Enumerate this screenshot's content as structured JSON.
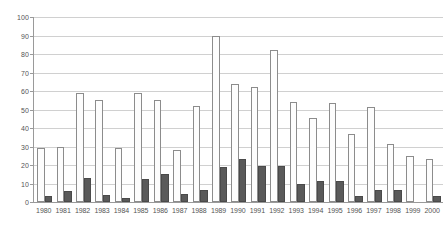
{
  "chart_data": {
    "type": "bar",
    "title": "",
    "subtitle": "",
    "xlabel": "",
    "ylabel": "",
    "ylim": [
      0,
      100
    ],
    "ytick_step": 10,
    "yticks": [
      0,
      10,
      20,
      30,
      40,
      50,
      60,
      70,
      80,
      90,
      100
    ],
    "ytick_labels": [
      "0",
      "10",
      "20",
      "30",
      "40",
      "50",
      "60",
      "70",
      "80",
      "90",
      "100"
    ],
    "grid": "horizontal",
    "legend": "none",
    "legend_position": "none",
    "annotations": [],
    "categories": [
      "1980",
      "1981",
      "1982",
      "1983",
      "1984",
      "1985",
      "1986",
      "1987",
      "1988",
      "1989",
      "1990",
      "1991",
      "1992",
      "1993",
      "1994",
      "1995",
      "1996",
      "1997",
      "1998",
      "1999",
      "2000"
    ],
    "series": [
      {
        "name": "light-series",
        "color": "#fdfdfd",
        "border_color": "#8c8c8c",
        "values": [
          29,
          30,
          59,
          55,
          29,
          59,
          55,
          28,
          52,
          90,
          64,
          62,
          82,
          54,
          45.5,
          53.5,
          36.5,
          51.5,
          31.5,
          25,
          23
        ]
      },
      {
        "name": "dark-series",
        "color": "#5a5a5a",
        "border_color": "#4a4a4a",
        "values": [
          3,
          6,
          13,
          4,
          2,
          12.5,
          15,
          4.5,
          6.5,
          19,
          23.5,
          19.5,
          19.5,
          9.5,
          11.5,
          11.5,
          3.5,
          6.5,
          6.5,
          0,
          3.5
        ]
      }
    ]
  },
  "colors": {
    "background": "#ffffff",
    "axis": "#9a9a9a",
    "gridline": "#d0d0d0",
    "tick_text": "#555555",
    "light_bar": "#fdfdfd",
    "light_bar_border": "#8c8c8c",
    "dark_bar": "#5a5a5a",
    "dark_bar_border": "#4a4a4a"
  }
}
